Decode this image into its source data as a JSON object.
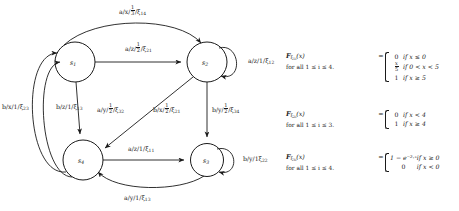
{
  "diagram": {
    "type": "probabilistic-finite-state-transducer",
    "states": [
      {
        "id": "s1",
        "label": "s",
        "sub": "1",
        "cx": 75,
        "cy": 62,
        "r": 20
      },
      {
        "id": "s2",
        "label": "s",
        "sub": "2",
        "cx": 207,
        "cy": 62,
        "r": 20
      },
      {
        "id": "s3",
        "label": "s",
        "sub": "3",
        "cx": 207,
        "cy": 160,
        "r": 17
      },
      {
        "id": "s4",
        "label": "s",
        "sub": "4",
        "cx": 83,
        "cy": 160,
        "r": 20
      }
    ],
    "transitions": [
      {
        "from": "s1",
        "to": "s2",
        "kind": "arc-top",
        "input": "a",
        "output": "x",
        "prob": "1/3",
        "rv": "ξ",
        "rv_sub": "14",
        "label": "a/x/⅓/ξ₁₄"
      },
      {
        "from": "s1",
        "to": "s2",
        "kind": "straight",
        "input": "a",
        "output": "z",
        "prob": "1/2",
        "rv": "ξ",
        "rv_sub": "21",
        "label": "a/z/½/ξ₂₁"
      },
      {
        "from": "s2",
        "to": "s2",
        "kind": "self-loop",
        "input": "a",
        "output": "z",
        "prob": "1",
        "rv": "ξ",
        "rv_sub": "12",
        "label": "a/z/1/ξ₁₂"
      },
      {
        "from": "s1",
        "to": "s4",
        "kind": "straight",
        "input": "a",
        "output": "y",
        "prob": "1/2",
        "rv": "ξ",
        "rv_sub": "32",
        "label": "a/y/½/ξ₃₂"
      },
      {
        "from": "s2",
        "to": "s4",
        "kind": "diagonal",
        "input": "b",
        "output": "x",
        "prob": "1/2",
        "rv": "ξ",
        "rv_sub": "21",
        "label": "b/x/½/ξ₂₁"
      },
      {
        "from": "s2",
        "to": "s3",
        "kind": "straight",
        "input": "b",
        "output": "y",
        "prob": "1/2",
        "rv": "ξ",
        "rv_sub": "34",
        "label": "b/y/½/ξ₃₄"
      },
      {
        "from": "s4",
        "to": "s1",
        "kind": "arc-outer",
        "input": "b",
        "output": "x",
        "prob": "1",
        "rv": "ξ",
        "rv_sub": "23",
        "label": "b/x/1/ξ₂₃"
      },
      {
        "from": "s4",
        "to": "s1",
        "kind": "arc-inner",
        "input": "b",
        "output": "z",
        "prob": "1",
        "rv": "ξ",
        "rv_sub": "13",
        "label": "b/z/1/ξ₁₃"
      },
      {
        "from": "s4",
        "to": "s3",
        "kind": "straight",
        "input": "a",
        "output": "z",
        "prob": "1",
        "rv": "ξ",
        "rv_sub": "11",
        "label": "a/z/1/ξ₁₁"
      },
      {
        "from": "s3",
        "to": "s3",
        "kind": "self-loop",
        "input": "b",
        "output": "y",
        "prob": "1",
        "rv": "ξ",
        "rv_sub": "22",
        "label": "b/y/1ξ₂₂"
      },
      {
        "from": "s3",
        "to": "s4",
        "kind": "arc-bottom",
        "input": "a",
        "output": "y",
        "prob": "1",
        "rv": "ξ",
        "rv_sub": "13",
        "label": "a/y/1/ξ₁₃"
      }
    ],
    "edge_labels": {
      "top_arc": {
        "sym": "a/x/",
        "frac_num": "1",
        "frac_den": "3",
        "tail": "/ξ",
        "tail_sub": "14"
      },
      "s1_s2": {
        "sym": "a/z/",
        "frac_num": "1",
        "frac_den": "2",
        "tail": "/ξ",
        "tail_sub": "21"
      },
      "s2_self": {
        "text_pre": "a/z/1/",
        "rv": "ξ",
        "rv_sub": "12"
      },
      "left_outer": {
        "text_pre": "b/x/1/",
        "rv": "ξ",
        "rv_sub": "23"
      },
      "left_inner": {
        "text_pre": "b/z/1/",
        "rv": "ξ",
        "rv_sub": "13"
      },
      "s1_s4": {
        "sym": "a/y/",
        "frac_num": "1",
        "frac_den": "2",
        "tail": "/ξ",
        "tail_sub": "32"
      },
      "s2_s4_diag": {
        "sym": "b/x/",
        "frac_num": "1",
        "frac_den": "2",
        "tail": "/ξ",
        "tail_sub": "21"
      },
      "s2_s3": {
        "sym": "b/y/",
        "frac_num": "1",
        "frac_den": "2",
        "tail": "/ξ",
        "tail_sub": "34"
      },
      "s4_s3": {
        "text_pre": "a/z/1/",
        "rv": "ξ",
        "rv_sub": "11"
      },
      "s3_self": {
        "text_pre": "b/y/1",
        "rv": "ξ",
        "rv_sub": "22"
      },
      "bottom_arc": {
        "text_pre": "a/y/1/",
        "rv": "ξ",
        "rv_sub": "13"
      }
    }
  },
  "equations": [
    {
      "id": "eq1",
      "fn": "F",
      "fn_sub_rv": "ξ",
      "fn_sub_idx": "1i",
      "arg": "(x)",
      "quantifier": "for all 1 ≤ i ≤ 4.",
      "eq": "=",
      "cases": [
        {
          "value": "0",
          "value_frac": null,
          "cond": "if x ≤ 0"
        },
        {
          "value": null,
          "value_frac": {
            "num": "x",
            "den": "5"
          },
          "cond": "if 0 < x < 5"
        },
        {
          "value": "1",
          "value_frac": null,
          "cond": "if x ≥ 5"
        }
      ]
    },
    {
      "id": "eq2",
      "fn": "F",
      "fn_sub_rv": "ξ",
      "fn_sub_idx": "2i",
      "arg": "(x)",
      "quantifier": "for all 1 ≤ i ≤ 3.",
      "eq": "=",
      "cases": [
        {
          "value": "0",
          "value_frac": null,
          "cond": "if x < 4"
        },
        {
          "value": "1",
          "value_frac": null,
          "cond": "if x ≥ 4"
        }
      ]
    },
    {
      "id": "eq3",
      "fn": "F",
      "fn_sub_rv": "ξ",
      "fn_sub_idx": "3i",
      "arg": "(x)",
      "quantifier": "for all 1 ≤ i ≤ 4.",
      "eq": "=",
      "cases": [
        {
          "value": "1 − e⁻²·ˣ",
          "value_frac": null,
          "cond": "if x ≥ 0"
        },
        {
          "value": "0",
          "value_frac": null,
          "cond": "if x < 0"
        }
      ]
    }
  ],
  "colors": {
    "ink": "#1a1a1a",
    "background": "#ffffff"
  }
}
